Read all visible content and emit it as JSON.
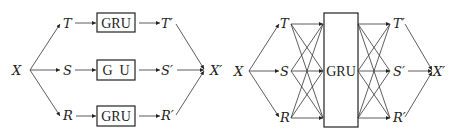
{
  "left_diagram": {
    "input": "X",
    "branches": [
      {
        "in": "T",
        "module": "GRU",
        "out": "T′"
      },
      {
        "in": "S",
        "module": "G  U",
        "out": "S′"
      },
      {
        "in": "R",
        "module": "GRU",
        "out": "R′"
      }
    ],
    "output": "X′"
  },
  "right_diagram": {
    "input": "X",
    "components": [
      "T",
      "S",
      "R"
    ],
    "module": "GRU",
    "outputs": [
      "T′",
      "S′",
      "R′"
    ],
    "output": "X′"
  },
  "colors": {
    "stroke": "#333333",
    "text": "#222222",
    "background": "#ffffff"
  }
}
